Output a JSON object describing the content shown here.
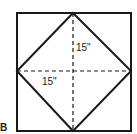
{
  "figure": {
    "panel_label": "B",
    "vertical_measure": "15\"",
    "horizontal_measure": "15\""
  },
  "geometry": {
    "outer_square": {
      "x": 17,
      "y": 13,
      "size": 114
    },
    "center": {
      "x": 73,
      "y": 71
    },
    "diamond_vertices": [
      [
        73,
        13
      ],
      [
        131,
        71
      ],
      [
        73,
        131
      ],
      [
        17,
        71
      ]
    ]
  },
  "colors": {
    "stroke": "#1a1a1a",
    "background": "#ffffff"
  }
}
